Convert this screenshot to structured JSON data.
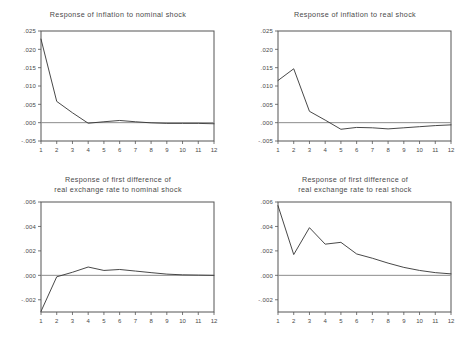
{
  "figure": {
    "title": "",
    "background_color": "#ffffff",
    "line_color": "#333333",
    "frame_color": "#555555",
    "zero_line_color": "#8c8c8c"
  },
  "panels": [
    {
      "id": "inflation-nominal",
      "title": "Response of inflation to nominal shock",
      "title_lines": [
        "Response of inflation to nominal shock"
      ],
      "x_tick_labels": [
        "1",
        "2",
        "3",
        "4",
        "5",
        "6",
        "7",
        "8",
        "9",
        "10",
        "11",
        "12"
      ],
      "y_tick_labels": [
        ".025",
        ".020",
        ".015",
        ".010",
        ".005",
        ".000",
        "-.005"
      ]
    },
    {
      "id": "inflation-real",
      "title": "Response of inflation to real shock",
      "title_lines": [
        "Response of inflation to real shock"
      ],
      "x_tick_labels": [
        "1",
        "2",
        "3",
        "4",
        "5",
        "6",
        "7",
        "8",
        "9",
        "10",
        "11",
        "12"
      ],
      "y_tick_labels": [
        ".025",
        ".020",
        ".015",
        ".010",
        ".005",
        ".000",
        "-.005"
      ]
    },
    {
      "id": "rer-nominal",
      "title": "Response of first difference of real exchange rate to nominal shock",
      "title_lines": [
        "Response of first difference of",
        "real exchange rate to nominal shock"
      ],
      "x_tick_labels": [
        "1",
        "2",
        "3",
        "4",
        "5",
        "6",
        "7",
        "8",
        "9",
        "10",
        "11",
        "12"
      ],
      "y_tick_labels": [
        ".006",
        ".004",
        ".002",
        ".000",
        "-.002"
      ]
    },
    {
      "id": "rer-real",
      "title": "Response of first difference of real exchange rate to real shock",
      "title_lines": [
        "Response of first difference of",
        "real exchange rate to real shock"
      ],
      "x_tick_labels": [
        "1",
        "2",
        "3",
        "4",
        "5",
        "6",
        "7",
        "8",
        "9",
        "10",
        "11",
        "12"
      ],
      "y_tick_labels": [
        ".006",
        ".004",
        ".002",
        ".000",
        "-.002"
      ]
    }
  ],
  "chart_data": [
    {
      "type": "line",
      "title": "Response of inflation to nominal shock",
      "xlabel": "",
      "ylabel": "",
      "x": [
        1,
        2,
        3,
        4,
        5,
        6,
        7,
        8,
        9,
        10,
        11,
        12
      ],
      "values": [
        0.0228,
        0.0058,
        0.0027,
        -0.00015,
        0.00025,
        0.0006,
        0.00025,
        -5e-05,
        -0.0002,
        -0.0002,
        -0.0002,
        -0.0003
      ],
      "xlim": [
        1,
        12
      ],
      "ylim": [
        -0.005,
        0.025
      ],
      "yticks": [
        -0.005,
        0.0,
        0.005,
        0.01,
        0.015,
        0.02,
        0.025
      ],
      "ytick_labels": [
        "-.005",
        ".000",
        ".005",
        ".010",
        ".015",
        ".020",
        ".025"
      ],
      "xticks": [
        1,
        2,
        3,
        4,
        5,
        6,
        7,
        8,
        9,
        10,
        11,
        12
      ],
      "grid": false,
      "legend": "none",
      "zero_line": 0.0
    },
    {
      "type": "line",
      "title": "Response of inflation to real shock",
      "xlabel": "",
      "ylabel": "",
      "x": [
        1,
        2,
        3,
        4,
        5,
        6,
        7,
        8,
        9,
        10,
        11,
        12
      ],
      "values": [
        0.0115,
        0.0147,
        0.0031,
        0.0007,
        -0.0018,
        -0.0013,
        -0.0014,
        -0.0017,
        -0.0014,
        -0.0011,
        -0.0008,
        -0.0006
      ],
      "xlim": [
        1,
        12
      ],
      "ylim": [
        -0.005,
        0.025
      ],
      "yticks": [
        -0.005,
        0.0,
        0.005,
        0.01,
        0.015,
        0.02,
        0.025
      ],
      "ytick_labels": [
        "-.005",
        ".000",
        ".005",
        ".010",
        ".015",
        ".020",
        ".025"
      ],
      "xticks": [
        1,
        2,
        3,
        4,
        5,
        6,
        7,
        8,
        9,
        10,
        11,
        12
      ],
      "grid": false,
      "legend": "none",
      "zero_line": 0.0
    },
    {
      "type": "line",
      "title": "Response of first difference of real exchange rate to nominal shock",
      "xlabel": "",
      "ylabel": "",
      "x": [
        1,
        2,
        3,
        4,
        5,
        6,
        7,
        8,
        9,
        10,
        11,
        12
      ],
      "values": [
        -0.00295,
        -0.00012,
        0.00025,
        0.00068,
        0.0004,
        0.00048,
        0.00035,
        0.00022,
        0.0001,
        4e-05,
        2e-05,
        0.0
      ],
      "xlim": [
        1,
        12
      ],
      "ylim": [
        -0.003,
        0.006
      ],
      "yticks": [
        -0.002,
        0.0,
        0.002,
        0.004,
        0.006
      ],
      "ytick_labels": [
        "-.002",
        ".000",
        ".002",
        ".004",
        ".006"
      ],
      "xticks": [
        1,
        2,
        3,
        4,
        5,
        6,
        7,
        8,
        9,
        10,
        11,
        12
      ],
      "grid": false,
      "legend": "none",
      "zero_line": 0.0
    },
    {
      "type": "line",
      "title": "Response of first difference of real exchange rate to real shock",
      "xlabel": "",
      "ylabel": "",
      "x": [
        1,
        2,
        3,
        4,
        5,
        6,
        7,
        8,
        9,
        10,
        11,
        12
      ],
      "values": [
        0.0057,
        0.0017,
        0.0039,
        0.00255,
        0.0027,
        0.00175,
        0.0014,
        0.001,
        0.00065,
        0.0004,
        0.00022,
        0.00012
      ],
      "xlim": [
        1,
        12
      ],
      "ylim": [
        -0.003,
        0.006
      ],
      "yticks": [
        -0.002,
        0.0,
        0.002,
        0.004,
        0.006
      ],
      "ytick_labels": [
        "-.002",
        ".000",
        ".002",
        ".004",
        ".006"
      ],
      "xticks": [
        1,
        2,
        3,
        4,
        5,
        6,
        7,
        8,
        9,
        10,
        11,
        12
      ],
      "grid": false,
      "legend": "none",
      "zero_line": 0.0
    }
  ]
}
